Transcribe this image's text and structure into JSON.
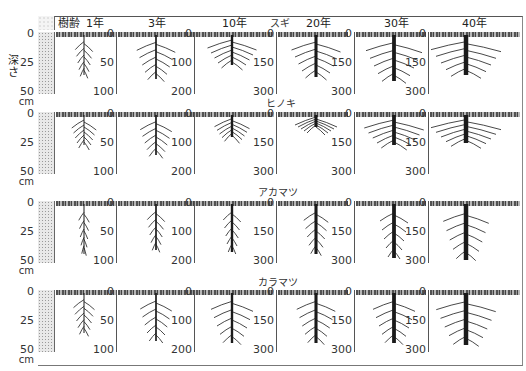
{
  "figure": {
    "header_label": "樹齢",
    "ages": [
      "1年",
      "3年",
      "10年",
      "20年",
      "30年",
      "40年"
    ],
    "depth_axis_title": "深さ",
    "left_axis": {
      "ticks": [
        "0",
        "25",
        "50"
      ],
      "unit": "cm"
    }
  },
  "species": [
    {
      "name": "スギ",
      "key": "sugi"
    },
    {
      "name": "ヒノキ",
      "key": "hinoki"
    },
    {
      "name": "アカマツ",
      "key": "akamatsu"
    },
    {
      "name": "カラマツ",
      "key": "karamatsu"
    }
  ],
  "column_axes": [
    {
      "age": "1年",
      "ticks": [
        "0",
        "25",
        "50"
      ]
    },
    {
      "age": "3年",
      "ticks": [
        "0",
        "50",
        "100"
      ]
    },
    {
      "age": "10年",
      "ticks": [
        "0",
        "100",
        "200"
      ]
    },
    {
      "age": "20年",
      "ticks": [
        "0",
        "150",
        "300"
      ]
    },
    {
      "age": "30年",
      "ticks": [
        "0",
        "150",
        "300"
      ]
    },
    {
      "age": "40年",
      "ticks": [
        "0",
        "150",
        "300"
      ]
    }
  ],
  "colors": {
    "root": "#1a1a1a",
    "soil": "#e8e8e8",
    "axis": "#555555"
  }
}
